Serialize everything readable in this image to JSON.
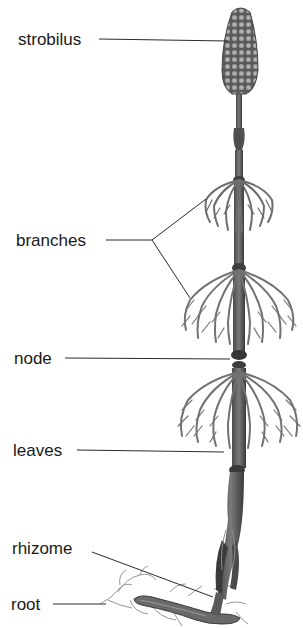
{
  "diagram": {
    "colors": {
      "background": "#ffffff",
      "label_text": "#1a1a1a",
      "leader_line": "#2a2a2a",
      "plant_dark": "#3a3a3a",
      "plant_mid": "#6e6e6e",
      "plant_light": "#a8a8a8"
    },
    "labels": [
      {
        "id": "strobilus",
        "text": "strobilus"
      },
      {
        "id": "branches",
        "text": "branches"
      },
      {
        "id": "node",
        "text": "node"
      },
      {
        "id": "leaves",
        "text": "leaves"
      },
      {
        "id": "rhizome",
        "text": "rhizome"
      },
      {
        "id": "root",
        "text": "root"
      }
    ]
  }
}
